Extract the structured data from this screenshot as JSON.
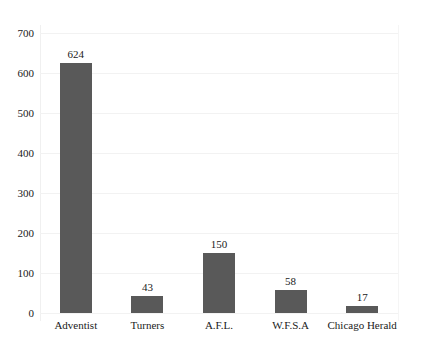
{
  "chart_data": {
    "type": "bar",
    "title": "",
    "subtitle": "",
    "xlabel": "",
    "ylabel": "",
    "categories": [
      "Adventist",
      "Turners",
      "A.F.L.",
      "W.F.S.A",
      "Chicago Herald"
    ],
    "values": [
      624,
      43,
      150,
      58,
      17
    ],
    "value_labels": [
      "624",
      "43",
      "150",
      "58",
      "17"
    ],
    "ylim": [
      0,
      700
    ],
    "ytick_labels": [
      "0",
      "100",
      "200",
      "300",
      "400",
      "500",
      "600",
      "700"
    ],
    "ytick_values": [
      0,
      100,
      200,
      300,
      400,
      500,
      600,
      700
    ],
    "grid": true,
    "legend": false,
    "legend_position": "none",
    "bar_color": "#595959",
    "grid_color": "#f2f2f2",
    "text_color": "#1a1a1a",
    "background": "#ffffff"
  }
}
